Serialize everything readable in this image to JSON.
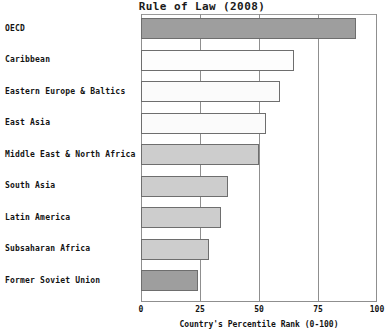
{
  "chart_data": {
    "type": "bar",
    "orientation": "horizontal",
    "title": "Rule of Law (2008)",
    "xlabel": "Country's Percentile Rank (0-100)",
    "ylabel": "",
    "xlim": [
      0,
      100
    ],
    "xticks": [
      "0",
      "25",
      "50",
      "75",
      "100"
    ],
    "xtick_values": [
      0,
      25,
      50,
      75,
      100
    ],
    "grid": true,
    "legend": false,
    "categories": [
      "OECD",
      "Caribbean",
      "Eastern Europe & Baltics",
      "East Asia",
      "Middle East & North Africa",
      "South Asia",
      "Latin America",
      "Subsaharan Africa",
      "Former Soviet Union"
    ],
    "values": [
      91,
      65,
      59,
      53,
      50,
      37,
      34,
      29,
      24
    ],
    "bar_colors": [
      "#9e9e9e",
      "#fdfdfd",
      "#fbfbfb",
      "#fbfbfb",
      "#cdcdcd",
      "#cdcdcd",
      "#cdcdcd",
      "#cdcdcd",
      "#9e9e9e"
    ],
    "bar_edge_color": "#6e6e6e"
  },
  "colors": {
    "dark_gray": "#9e9e9e",
    "light_gray": "#cdcdcd",
    "white": "#fdfdfd",
    "axis": "#8f8f8f",
    "text": "#131313",
    "background": "#ffffff"
  }
}
